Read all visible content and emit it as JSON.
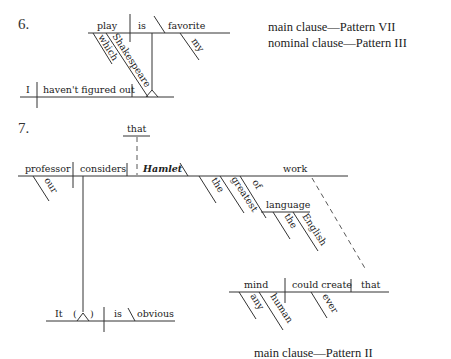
{
  "diagram6": {
    "number": "6.",
    "main_line": {
      "subject": "play",
      "verb": "is",
      "complement": "favorite",
      "modifier": "my"
    },
    "relative_modifiers": [
      "which",
      "Shakespeare"
    ],
    "nominal_line": {
      "subject": "I",
      "verb": "haven't figured out"
    },
    "labels": [
      "main clause—Pattern VII",
      "nominal clause—Pattern III"
    ]
  },
  "diagram7": {
    "number": "7.",
    "main_line": {
      "subject": "professor",
      "subject_modifier": "our",
      "verb": "considers",
      "expletive": "that",
      "object": "Hamlet",
      "object_complement": "work",
      "complement_modifiers": [
        "the",
        "greatest",
        "of"
      ]
    },
    "prep_phrase": {
      "object": "language",
      "modifiers": [
        "the",
        "English"
      ]
    },
    "relative_clause": {
      "subject": "mind",
      "subject_modifiers": [
        "any",
        "human"
      ],
      "verb": "could create",
      "object": "that",
      "verb_modifier": "ever"
    },
    "base_line": {
      "subject": "It",
      "paren_open": "(",
      "paren_close": ")",
      "verb": "is",
      "complement": "obvious"
    },
    "labels": [
      "main clause—Pattern II"
    ]
  }
}
